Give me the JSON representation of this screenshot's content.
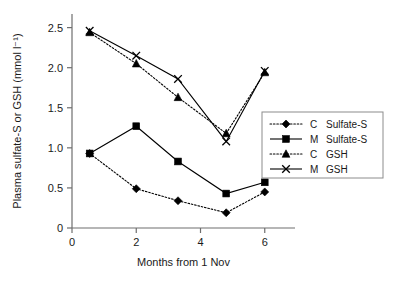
{
  "chart_data": {
    "type": "line",
    "title": "",
    "xlabel": "Months from 1 Nov",
    "ylabel": "Plasma sulfate-S or GSH (mmol l⁻¹)",
    "xlim": [
      0,
      6.35
    ],
    "ylim": [
      0,
      2.62
    ],
    "xticks": [
      0,
      2,
      4,
      6
    ],
    "xtick_labels": [
      "0",
      "2",
      "4",
      "6"
    ],
    "yticks": [
      0,
      0.5,
      1.0,
      1.5,
      2.0,
      2.5
    ],
    "ytick_labels": [
      "0",
      "0.5",
      "1.0",
      "1.5",
      "2.0",
      "2.5"
    ],
    "grid": false,
    "legend_position": "right-middle",
    "x": [
      0.55,
      2.0,
      3.3,
      4.8,
      6.0
    ],
    "series": [
      {
        "name": "C  Sulfate-S",
        "group": "C",
        "measure": "Sulfate-S",
        "marker": "diamond",
        "linestyle": "dotted",
        "color": "#000000",
        "values": [
          0.93,
          0.49,
          0.34,
          0.19,
          0.45
        ]
      },
      {
        "name": "M  Sulfate-S",
        "group": "M",
        "measure": "Sulfate-S",
        "marker": "square",
        "linestyle": "solid",
        "color": "#000000",
        "values": [
          0.93,
          1.27,
          0.83,
          0.43,
          0.57
        ]
      },
      {
        "name": "C  GSH",
        "group": "C",
        "measure": "GSH",
        "marker": "triangle",
        "linestyle": "dotted",
        "color": "#000000",
        "values": [
          2.44,
          2.05,
          1.63,
          1.18,
          1.94
        ]
      },
      {
        "name": "M  GSH",
        "group": "M",
        "measure": "GSH",
        "marker": "cross",
        "linestyle": "solid",
        "color": "#000000",
        "values": [
          2.46,
          2.15,
          1.86,
          1.08,
          1.96
        ]
      }
    ]
  },
  "legend": {
    "entries": [
      {
        "group": "C",
        "measure": "Sulfate-S"
      },
      {
        "group": "M",
        "measure": "Sulfate-S"
      },
      {
        "group": "C",
        "measure": "GSH"
      },
      {
        "group": "M",
        "measure": "GSH"
      }
    ]
  }
}
